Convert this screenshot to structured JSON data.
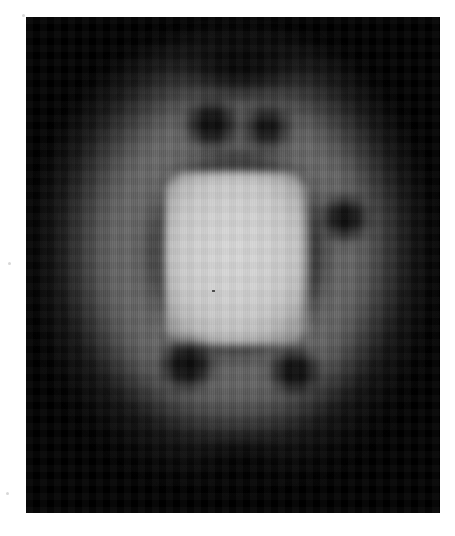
{
  "image": {
    "kind": "grayscale-scan",
    "description": "Grayscale tomographic scan showing a bright rounded-square central core surrounded by a dark annulus and a diffuse mid-gray halo on a black rectangular field",
    "panel": {
      "x": 26,
      "y": 17,
      "width": 414,
      "height": 496,
      "background_color": "#000000"
    },
    "page": {
      "width": 455,
      "height": 536,
      "background_color": "#ffffff"
    },
    "palette": {
      "background": "#000000",
      "page": "#ffffff",
      "core_bright": "#d0d0d0",
      "core_edge": "#9a9a9a",
      "ring_mid_gray": "#6e6e6e",
      "ring_dark": "#141414",
      "halo_faint": "#3a3a3a"
    },
    "features": [
      {
        "name": "bright-core",
        "cx": 236,
        "cy": 258,
        "w": 142,
        "h": 173,
        "intensity": "#d0d0d0"
      },
      {
        "name": "dark-annulus",
        "cx": 236,
        "cy": 253,
        "w": 186,
        "h": 216,
        "intensity": "#141414"
      },
      {
        "name": "mid-gray-ring",
        "cx": 234,
        "cy": 256,
        "w": 336,
        "h": 390,
        "intensity": "#6e6e6e"
      },
      {
        "name": "diffuse-halo",
        "cx": 233,
        "cy": 250,
        "w": 474,
        "h": 540,
        "intensity": "#3a3a3a"
      },
      {
        "name": "dark-spot-top-left",
        "cx": 212,
        "cy": 124,
        "w": 52,
        "h": 44,
        "intensity": "#050505"
      },
      {
        "name": "dark-spot-top-right",
        "cx": 267,
        "cy": 127,
        "w": 46,
        "h": 40,
        "intensity": "#080808"
      },
      {
        "name": "dark-spot-right",
        "cx": 345,
        "cy": 218,
        "w": 44,
        "h": 42,
        "intensity": "#060606"
      },
      {
        "name": "dark-spot-lower-left",
        "cx": 187,
        "cy": 365,
        "w": 52,
        "h": 46,
        "intensity": "#050505"
      },
      {
        "name": "dark-spot-lower-right",
        "cx": 295,
        "cy": 371,
        "w": 48,
        "h": 42,
        "intensity": "#060606"
      },
      {
        "name": "dark-band-bottom",
        "cx": 242,
        "cy": 472,
        "w": 96,
        "h": 50,
        "intensity": "#0a0a0a"
      },
      {
        "name": "dark-gap-top",
        "cx": 241,
        "cy": 65,
        "w": 130,
        "h": 52,
        "intensity": "#000000"
      },
      {
        "name": "core-speck",
        "cx": 186,
        "cy": 273,
        "w": 3,
        "h": 2,
        "intensity": "#4a4a4a"
      }
    ],
    "texture": {
      "scanlines": "vertical",
      "pixelation": "coarse-voxel-grid"
    }
  }
}
